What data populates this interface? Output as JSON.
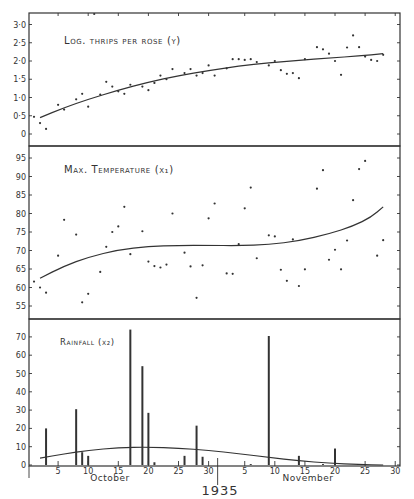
{
  "chart_data": [
    {
      "type": "scatter",
      "title": "Log. thrips per rose (y)",
      "xlabel": "",
      "ylabel": "",
      "ylim": [
        -0.35,
        3.25
      ],
      "yticks": [
        "0",
        "0·5",
        "1·0",
        "1·5",
        "2·0",
        "2·5",
        "3·0"
      ],
      "ytick_values": [
        0,
        0.5,
        1.0,
        1.5,
        2.0,
        2.5,
        3.0
      ],
      "grid": false,
      "points": [
        {
          "day": "Oct 1",
          "x": 1,
          "y": 0.47
        },
        {
          "day": "Oct 2",
          "x": 2,
          "y": 0.3
        },
        {
          "day": "Oct 3",
          "x": 3,
          "y": 0.14
        },
        {
          "day": "Oct 5",
          "x": 5,
          "y": 0.8
        },
        {
          "day": "Oct 6",
          "x": 6,
          "y": 0.67
        },
        {
          "day": "Oct 8",
          "x": 8,
          "y": 0.95
        },
        {
          "day": "Oct 9",
          "x": 9,
          "y": 1.1
        },
        {
          "day": "Oct 10",
          "x": 10,
          "y": 0.75
        },
        {
          "day": "Oct 12",
          "x": 12,
          "y": 1.08
        },
        {
          "day": "Oct 13",
          "x": 13,
          "y": 1.43
        },
        {
          "day": "Oct 14",
          "x": 14,
          "y": 1.3
        },
        {
          "day": "Oct 15",
          "x": 15,
          "y": 1.17
        },
        {
          "day": "Oct 16",
          "x": 16,
          "y": 1.1
        },
        {
          "day": "Oct 17",
          "x": 17,
          "y": 1.35
        },
        {
          "day": "Oct 19",
          "x": 19,
          "y": 1.3
        },
        {
          "day": "Oct 20",
          "x": 20,
          "y": 1.2
        },
        {
          "day": "Oct 21",
          "x": 21,
          "y": 1.4
        },
        {
          "day": "Oct 22",
          "x": 22,
          "y": 1.6
        },
        {
          "day": "Oct 23",
          "x": 23,
          "y": 1.5
        },
        {
          "day": "Oct 24",
          "x": 24,
          "y": 1.78
        },
        {
          "day": "Oct 26",
          "x": 26,
          "y": 1.67
        },
        {
          "day": "Oct 27",
          "x": 27,
          "y": 1.78
        },
        {
          "day": "Oct 28",
          "x": 28,
          "y": 1.6
        },
        {
          "day": "Oct 29",
          "x": 29,
          "y": 1.67
        },
        {
          "day": "Oct 30",
          "x": 30,
          "y": 1.88
        },
        {
          "day": "Oct 31",
          "x": 31,
          "y": 1.6
        },
        {
          "day": "Nov 2",
          "x": 33,
          "y": 1.8
        },
        {
          "day": "Nov 3",
          "x": 34,
          "y": 2.05
        },
        {
          "day": "Nov 4",
          "x": 35,
          "y": 2.05
        },
        {
          "day": "Nov 5",
          "x": 36,
          "y": 2.03
        },
        {
          "day": "Nov 6",
          "x": 37,
          "y": 2.05
        },
        {
          "day": "Nov 7",
          "x": 38,
          "y": 1.97
        },
        {
          "day": "Nov 9",
          "x": 40,
          "y": 1.88
        },
        {
          "day": "Nov 10",
          "x": 41,
          "y": 2.0
        },
        {
          "day": "Nov 11",
          "x": 42,
          "y": 1.75
        },
        {
          "day": "Nov 12",
          "x": 43,
          "y": 1.65
        },
        {
          "day": "Nov 13",
          "x": 44,
          "y": 1.67
        },
        {
          "day": "Nov 14",
          "x": 45,
          "y": 1.53
        },
        {
          "day": "Nov 15",
          "x": 46,
          "y": 2.05
        },
        {
          "day": "Nov 17",
          "x": 48,
          "y": 2.38
        },
        {
          "day": "Nov 18",
          "x": 49,
          "y": 2.32
        },
        {
          "day": "Nov 19",
          "x": 50,
          "y": 2.2
        },
        {
          "day": "Nov 20",
          "x": 51,
          "y": 2.0
        },
        {
          "day": "Nov 21",
          "x": 52,
          "y": 1.62
        },
        {
          "day": "Nov 22",
          "x": 53,
          "y": 2.37
        },
        {
          "day": "Nov 23",
          "x": 54,
          "y": 2.7
        },
        {
          "day": "Nov 24",
          "x": 55,
          "y": 2.38
        },
        {
          "day": "Nov 25",
          "x": 56,
          "y": 2.12
        },
        {
          "day": "Nov 26",
          "x": 57,
          "y": 2.03
        },
        {
          "day": "Nov 27",
          "x": 58,
          "y": 2.0
        },
        {
          "day": "Nov 28",
          "x": 59,
          "y": 2.17
        },
        {
          "day": "Oct 11",
          "x": 11,
          "y": 3.3
        }
      ],
      "trend_curve": [
        [
          2,
          0.45
        ],
        [
          6,
          0.72
        ],
        [
          10,
          0.95
        ],
        [
          15,
          1.2
        ],
        [
          20,
          1.42
        ],
        [
          25,
          1.6
        ],
        [
          30,
          1.74
        ],
        [
          35,
          1.86
        ],
        [
          40,
          1.95
        ],
        [
          45,
          2.02
        ],
        [
          50,
          2.08
        ],
        [
          55,
          2.14
        ],
        [
          59,
          2.2
        ]
      ]
    },
    {
      "type": "scatter",
      "title": "Max. Temperature (x₁)",
      "xlabel": "",
      "ylabel": "",
      "ylim": [
        51.5,
        98.5
      ],
      "yticks": [
        "55",
        "60",
        "65",
        "70",
        "75",
        "80",
        "85",
        "90",
        "95"
      ],
      "ytick_values": [
        55,
        60,
        65,
        70,
        75,
        80,
        85,
        90,
        95
      ],
      "grid": false,
      "points": [
        {
          "day": "Oct 1",
          "x": 1,
          "y": 61.6
        },
        {
          "day": "Oct 2",
          "x": 2,
          "y": 60
        },
        {
          "day": "Oct 3",
          "x": 3,
          "y": 58.6
        },
        {
          "day": "Oct 5",
          "x": 5,
          "y": 68.6
        },
        {
          "day": "Oct 6",
          "x": 6,
          "y": 78.3
        },
        {
          "day": "Oct 8",
          "x": 8,
          "y": 74.3
        },
        {
          "day": "Oct 9",
          "x": 9,
          "y": 56
        },
        {
          "day": "Oct 10",
          "x": 10,
          "y": 58.3
        },
        {
          "day": "Oct 12",
          "x": 12,
          "y": 64.2
        },
        {
          "day": "Oct 13",
          "x": 13,
          "y": 71
        },
        {
          "day": "Oct 14",
          "x": 14,
          "y": 75
        },
        {
          "day": "Oct 15",
          "x": 15,
          "y": 76.5
        },
        {
          "day": "Oct 16",
          "x": 16,
          "y": 81.8
        },
        {
          "day": "Oct 17",
          "x": 17,
          "y": 69
        },
        {
          "day": "Oct 19",
          "x": 19,
          "y": 75.2
        },
        {
          "day": "Oct 20",
          "x": 20,
          "y": 67
        },
        {
          "day": "Oct 21",
          "x": 21,
          "y": 65.8
        },
        {
          "day": "Oct 22",
          "x": 22,
          "y": 65.4
        },
        {
          "day": "Oct 23",
          "x": 23,
          "y": 66.2
        },
        {
          "day": "Oct 24",
          "x": 24,
          "y": 80
        },
        {
          "day": "Oct 26",
          "x": 26,
          "y": 69.4
        },
        {
          "day": "Oct 27",
          "x": 27,
          "y": 65.7
        },
        {
          "day": "Oct 28",
          "x": 28,
          "y": 57.2
        },
        {
          "day": "Oct 29",
          "x": 29,
          "y": 66
        },
        {
          "day": "Oct 30",
          "x": 30,
          "y": 78.7
        },
        {
          "day": "Oct 31",
          "x": 31,
          "y": 82.7
        },
        {
          "day": "Nov 2",
          "x": 33,
          "y": 63.8
        },
        {
          "day": "Nov 3",
          "x": 34,
          "y": 63.7
        },
        {
          "day": "Nov 4",
          "x": 35,
          "y": 71.7
        },
        {
          "day": "Nov 5",
          "x": 36,
          "y": 81.4
        },
        {
          "day": "Nov 6",
          "x": 37,
          "y": 87
        },
        {
          "day": "Nov 7",
          "x": 38,
          "y": 67.9
        },
        {
          "day": "Nov 9",
          "x": 40,
          "y": 74.1
        },
        {
          "day": "Nov 10",
          "x": 41,
          "y": 73.8
        },
        {
          "day": "Nov 11",
          "x": 42,
          "y": 64.8
        },
        {
          "day": "Nov 12",
          "x": 43,
          "y": 61.8
        },
        {
          "day": "Nov 13",
          "x": 44,
          "y": 73
        },
        {
          "day": "Nov 14",
          "x": 45,
          "y": 60.4
        },
        {
          "day": "Nov 15",
          "x": 46,
          "y": 64.9
        },
        {
          "day": "Nov 17",
          "x": 48,
          "y": 86.7
        },
        {
          "day": "Nov 18",
          "x": 49,
          "y": 91.7
        },
        {
          "day": "Nov 19",
          "x": 50,
          "y": 67.5
        },
        {
          "day": "Nov 20",
          "x": 51,
          "y": 70.2
        },
        {
          "day": "Nov 21",
          "x": 52,
          "y": 64.9
        },
        {
          "day": "Nov 22",
          "x": 53,
          "y": 72.7
        },
        {
          "day": "Nov 23",
          "x": 54,
          "y": 83.6
        },
        {
          "day": "Nov 24",
          "x": 55,
          "y": 92
        },
        {
          "day": "Nov 25",
          "x": 56,
          "y": 94.2
        },
        {
          "day": "Nov 27",
          "x": 58,
          "y": 68.6
        },
        {
          "day": "Nov 28",
          "x": 59,
          "y": 72.8
        }
      ],
      "trend_curve": [
        [
          2,
          62.5
        ],
        [
          6,
          65.8
        ],
        [
          10,
          68.2
        ],
        [
          15,
          70.2
        ],
        [
          20,
          71.1
        ],
        [
          25,
          71.4
        ],
        [
          30,
          71.4
        ],
        [
          35,
          71.3
        ],
        [
          40,
          71.6
        ],
        [
          45,
          72.6
        ],
        [
          50,
          74.5
        ],
        [
          54,
          76.6
        ],
        [
          57,
          79
        ],
        [
          59,
          81.8
        ]
      ]
    },
    {
      "type": "bar",
      "title": "Rainfall (x₂)",
      "xlabel": "",
      "ylabel": "",
      "ylim": [
        0,
        80
      ],
      "yticks": [
        "0",
        "10",
        "20",
        "30",
        "40",
        "50",
        "60",
        "70"
      ],
      "ytick_values": [
        0,
        10,
        20,
        30,
        40,
        50,
        60,
        70
      ],
      "grid": false,
      "categories": [
        "Oct 3",
        "Oct 8",
        "Oct 9",
        "Oct 10",
        "Oct 17",
        "Oct 19",
        "Oct 20",
        "Oct 21",
        "Oct 26",
        "Oct 28",
        "Oct 29",
        "Nov 6",
        "Nov 9",
        "Nov 14",
        "Nov 18",
        "Nov 20",
        "Nov 25"
      ],
      "x": [
        3,
        8,
        9,
        10,
        17,
        19,
        20,
        21,
        26,
        28,
        29,
        37,
        40,
        45,
        49,
        51,
        56
      ],
      "values": [
        20,
        30.5,
        7,
        5,
        74,
        54,
        28.5,
        1.5,
        5,
        21.5,
        4.5,
        0.5,
        70.5,
        5,
        0.5,
        9,
        0.5
      ],
      "trend_curve": [
        [
          2,
          3.8
        ],
        [
          6,
          6
        ],
        [
          10,
          8
        ],
        [
          15,
          9.5
        ],
        [
          20,
          9.8
        ],
        [
          25,
          9.2
        ],
        [
          30,
          8
        ],
        [
          35,
          6.2
        ],
        [
          40,
          4.2
        ],
        [
          45,
          2.3
        ],
        [
          50,
          1
        ],
        [
          55,
          0.3
        ],
        [
          59,
          0
        ]
      ]
    }
  ],
  "xaxis": {
    "ticks": [
      "5",
      "10",
      "15",
      "20",
      "25",
      "30",
      "5",
      "10",
      "15",
      "20",
      "25",
      "30"
    ],
    "tick_days": [
      5,
      10,
      15,
      20,
      25,
      30,
      36,
      41,
      46,
      51,
      56,
      61
    ],
    "months": [
      "October",
      "November"
    ],
    "year": "1935"
  }
}
